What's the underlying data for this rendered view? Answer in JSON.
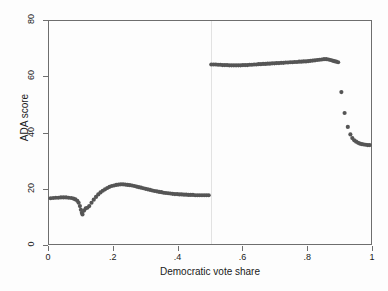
{
  "figure": {
    "background": "#fdfdfd",
    "frame_color": "#6e6e6e",
    "marker_color": "#555555",
    "cutoff_line_color": "#e2e2e2"
  },
  "chart_data": {
    "type": "scatter",
    "title": "",
    "subtitle": "",
    "xlabel": "Democratic vote share",
    "ylabel": "ADA score",
    "xlim": [
      0,
      1
    ],
    "ylim": [
      0,
      80
    ],
    "xticks": [
      0,
      0.2,
      0.4,
      0.6,
      0.8,
      1
    ],
    "xticklabels": [
      "0",
      ".2",
      ".4",
      ".6",
      ".8",
      "1"
    ],
    "yticks": [
      0,
      20,
      40,
      60,
      80
    ],
    "yticklabels": [
      "0",
      "20",
      "40",
      "60",
      "80"
    ],
    "grid": false,
    "legend": null,
    "annotations": [
      {
        "type": "vline",
        "x": 0.5,
        "label": "cutoff at 0.5",
        "color": "#e2e2e2"
      }
    ],
    "marker": {
      "shape": "circle",
      "size": 2.1,
      "color": "#555555"
    },
    "series": [
      {
        "name": "Left of cutoff (Republican win)",
        "color": "#555555",
        "points": [
          [
            0.005,
            16.4
          ],
          [
            0.013,
            16.5
          ],
          [
            0.021,
            16.6
          ],
          [
            0.029,
            16.6
          ],
          [
            0.037,
            16.7
          ],
          [
            0.045,
            16.7
          ],
          [
            0.053,
            16.7
          ],
          [
            0.061,
            16.6
          ],
          [
            0.069,
            16.5
          ],
          [
            0.076,
            16.3
          ],
          [
            0.082,
            16.0
          ],
          [
            0.088,
            15.5
          ],
          [
            0.092,
            14.8
          ],
          [
            0.096,
            13.6
          ],
          [
            0.099,
            12.3
          ],
          [
            0.102,
            11.2
          ],
          [
            0.104,
            10.6
          ],
          [
            0.109,
            12.0
          ],
          [
            0.114,
            12.8
          ],
          [
            0.119,
            13.0
          ],
          [
            0.125,
            13.6
          ],
          [
            0.132,
            14.8
          ],
          [
            0.139,
            15.9
          ],
          [
            0.146,
            16.9
          ],
          [
            0.153,
            17.8
          ],
          [
            0.16,
            18.5
          ],
          [
            0.167,
            19.1
          ],
          [
            0.174,
            19.6
          ],
          [
            0.181,
            20.1
          ],
          [
            0.188,
            20.5
          ],
          [
            0.195,
            20.8
          ],
          [
            0.202,
            21.0
          ],
          [
            0.209,
            21.2
          ],
          [
            0.216,
            21.3
          ],
          [
            0.223,
            21.4
          ],
          [
            0.23,
            21.4
          ],
          [
            0.237,
            21.3
          ],
          [
            0.244,
            21.2
          ],
          [
            0.251,
            21.1
          ],
          [
            0.258,
            21.0
          ],
          [
            0.265,
            20.8
          ],
          [
            0.272,
            20.6
          ],
          [
            0.279,
            20.4
          ],
          [
            0.286,
            20.2
          ],
          [
            0.293,
            20.0
          ],
          [
            0.3,
            19.8
          ],
          [
            0.307,
            19.6
          ],
          [
            0.314,
            19.4
          ],
          [
            0.321,
            19.2
          ],
          [
            0.328,
            19.0
          ],
          [
            0.335,
            18.9
          ],
          [
            0.342,
            18.7
          ],
          [
            0.349,
            18.6
          ],
          [
            0.356,
            18.4
          ],
          [
            0.363,
            18.3
          ],
          [
            0.37,
            18.2
          ],
          [
            0.377,
            18.1
          ],
          [
            0.384,
            18.0
          ],
          [
            0.391,
            17.9
          ],
          [
            0.398,
            17.9
          ],
          [
            0.405,
            17.8
          ],
          [
            0.412,
            17.8
          ],
          [
            0.419,
            17.7
          ],
          [
            0.426,
            17.7
          ],
          [
            0.433,
            17.6
          ],
          [
            0.44,
            17.6
          ],
          [
            0.447,
            17.6
          ],
          [
            0.454,
            17.5
          ],
          [
            0.461,
            17.5
          ],
          [
            0.468,
            17.5
          ],
          [
            0.475,
            17.5
          ],
          [
            0.482,
            17.5
          ],
          [
            0.489,
            17.5
          ],
          [
            0.496,
            17.5
          ]
        ]
      },
      {
        "name": "Right of cutoff (Democrat win)",
        "color": "#555555",
        "points": [
          [
            0.504,
            64.4
          ],
          [
            0.511,
            64.4
          ],
          [
            0.518,
            64.4
          ],
          [
            0.525,
            64.3
          ],
          [
            0.532,
            64.3
          ],
          [
            0.539,
            64.2
          ],
          [
            0.546,
            64.2
          ],
          [
            0.553,
            64.2
          ],
          [
            0.56,
            64.1
          ],
          [
            0.567,
            64.1
          ],
          [
            0.574,
            64.1
          ],
          [
            0.581,
            64.1
          ],
          [
            0.588,
            64.1
          ],
          [
            0.595,
            64.1
          ],
          [
            0.602,
            64.2
          ],
          [
            0.609,
            64.2
          ],
          [
            0.616,
            64.2
          ],
          [
            0.623,
            64.3
          ],
          [
            0.63,
            64.3
          ],
          [
            0.637,
            64.4
          ],
          [
            0.644,
            64.4
          ],
          [
            0.651,
            64.5
          ],
          [
            0.658,
            64.5
          ],
          [
            0.665,
            64.6
          ],
          [
            0.672,
            64.6
          ],
          [
            0.679,
            64.7
          ],
          [
            0.686,
            64.7
          ],
          [
            0.693,
            64.8
          ],
          [
            0.7,
            64.8
          ],
          [
            0.707,
            64.9
          ],
          [
            0.714,
            64.9
          ],
          [
            0.721,
            65.0
          ],
          [
            0.728,
            65.0
          ],
          [
            0.735,
            65.1
          ],
          [
            0.742,
            65.1
          ],
          [
            0.749,
            65.2
          ],
          [
            0.756,
            65.2
          ],
          [
            0.763,
            65.3
          ],
          [
            0.77,
            65.3
          ],
          [
            0.777,
            65.4
          ],
          [
            0.784,
            65.4
          ],
          [
            0.791,
            65.5
          ],
          [
            0.798,
            65.5
          ],
          [
            0.805,
            65.6
          ],
          [
            0.812,
            65.7
          ],
          [
            0.819,
            65.8
          ],
          [
            0.826,
            65.9
          ],
          [
            0.833,
            66.0
          ],
          [
            0.84,
            66.1
          ],
          [
            0.847,
            66.2
          ],
          [
            0.854,
            66.3
          ],
          [
            0.861,
            66.3
          ],
          [
            0.868,
            66.2
          ],
          [
            0.874,
            66.0
          ],
          [
            0.88,
            65.8
          ],
          [
            0.886,
            65.6
          ],
          [
            0.892,
            65.4
          ],
          [
            0.898,
            65.2
          ],
          [
            0.908,
            54.5
          ],
          [
            0.918,
            47.0
          ],
          [
            0.928,
            42.0
          ],
          [
            0.936,
            39.3
          ],
          [
            0.942,
            38.0
          ],
          [
            0.948,
            37.2
          ],
          [
            0.954,
            36.7
          ],
          [
            0.96,
            36.3
          ],
          [
            0.966,
            36.0
          ],
          [
            0.972,
            35.8
          ],
          [
            0.978,
            35.7
          ],
          [
            0.984,
            35.6
          ],
          [
            0.99,
            35.5
          ],
          [
            0.996,
            35.5
          ]
        ]
      }
    ]
  }
}
